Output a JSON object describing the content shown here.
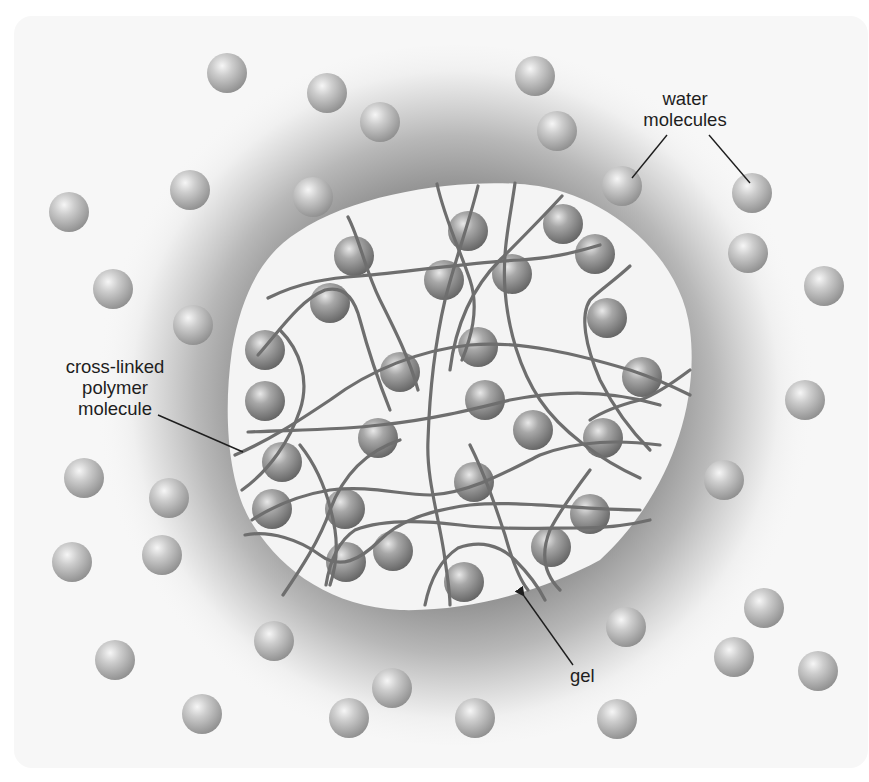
{
  "diagram": {
    "title": "",
    "labels": {
      "water": [
        "water",
        "molecules"
      ],
      "polymer": [
        "cross-linked",
        "polymer",
        "molecule"
      ],
      "gel": "gel"
    },
    "colors": {
      "background": "#ffffff",
      "panel_fill": "#f7f7f7",
      "panel_border": "#3a3a3a",
      "halo_dark": "#8c8c8c",
      "gel_fill": "#f4f4f4",
      "polymer_strand": "#6e6e6e",
      "water_sphere_light": "#e2e2e2",
      "water_sphere_dark": "#8e8e8e",
      "gel_sphere_light": "#d6d6d6",
      "gel_sphere_dark": "#6f6f6f",
      "leader_line": "#1e1e1e"
    },
    "nodes": [
      {
        "id": "water-molecules",
        "label": "water molecules",
        "kind": "free-sphere",
        "count": 31
      },
      {
        "id": "gel",
        "label": "gel",
        "kind": "region"
      },
      {
        "id": "cross-linked-polymer",
        "label": "cross-linked polymer molecule",
        "kind": "network"
      },
      {
        "id": "bound-water",
        "label": "",
        "kind": "trapped-sphere",
        "count": 26
      }
    ],
    "edges": [
      {
        "from": "water-molecules-label",
        "to": "water-molecule",
        "kind": "leader-line"
      },
      {
        "from": "polymer-label",
        "to": "cross-linked-polymer",
        "kind": "leader-line"
      },
      {
        "from": "gel-label",
        "to": "gel",
        "kind": "arrow"
      }
    ],
    "free_spheres": [
      [
        227,
        73
      ],
      [
        327,
        93
      ],
      [
        380,
        122
      ],
      [
        535,
        76
      ],
      [
        557,
        131
      ],
      [
        190,
        190
      ],
      [
        313,
        197
      ],
      [
        69,
        212
      ],
      [
        622,
        186
      ],
      [
        752,
        193
      ],
      [
        748,
        253
      ],
      [
        113,
        289
      ],
      [
        193,
        325
      ],
      [
        824,
        286
      ],
      [
        805,
        400
      ],
      [
        84,
        478
      ],
      [
        169,
        498
      ],
      [
        724,
        480
      ],
      [
        72,
        562
      ],
      [
        162,
        555
      ],
      [
        764,
        608
      ],
      [
        115,
        660
      ],
      [
        274,
        641
      ],
      [
        626,
        627
      ],
      [
        734,
        657
      ],
      [
        818,
        671
      ],
      [
        392,
        688
      ],
      [
        202,
        714
      ],
      [
        349,
        718
      ],
      [
        475,
        718
      ],
      [
        617,
        719
      ]
    ],
    "gel_spheres": [
      [
        354,
        256
      ],
      [
        468,
        231
      ],
      [
        563,
        224
      ],
      [
        595,
        254
      ],
      [
        330,
        303
      ],
      [
        444,
        280
      ],
      [
        512,
        274
      ],
      [
        607,
        318
      ],
      [
        265,
        350
      ],
      [
        400,
        372
      ],
      [
        478,
        347
      ],
      [
        642,
        377
      ],
      [
        265,
        401
      ],
      [
        485,
        400
      ],
      [
        378,
        438
      ],
      [
        533,
        430
      ],
      [
        603,
        438
      ],
      [
        282,
        462
      ],
      [
        474,
        482
      ],
      [
        272,
        509
      ],
      [
        345,
        509
      ],
      [
        590,
        514
      ],
      [
        393,
        551
      ],
      [
        346,
        562
      ],
      [
        551,
        547
      ],
      [
        464,
        582
      ]
    ]
  }
}
